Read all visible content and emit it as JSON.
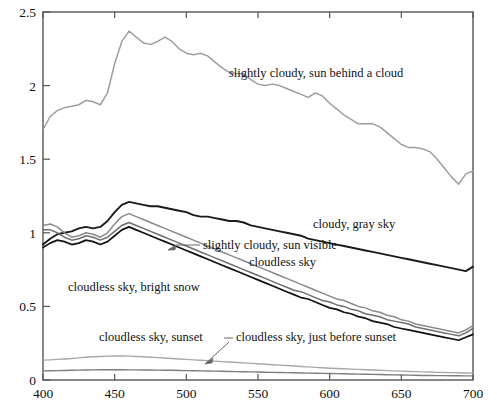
{
  "chart_data": {
    "type": "line",
    "title": "",
    "xlabel": "",
    "ylabel": "",
    "xlim": [
      400,
      700
    ],
    "ylim": [
      0,
      2.5
    ],
    "xticks": [
      400,
      450,
      500,
      550,
      600,
      650,
      700
    ],
    "yticks": [
      0,
      0.5,
      1,
      1.5,
      2,
      2.5
    ],
    "xtick_labels": [
      "400",
      "450",
      "500",
      "550",
      "600",
      "650",
      "700"
    ],
    "ytick_labels": [
      "0",
      "0.5",
      "1",
      "1.5",
      "2",
      "2.5"
    ],
    "grid": false,
    "legend": "inline-annotations",
    "x": [
      400,
      405,
      410,
      415,
      420,
      425,
      430,
      435,
      440,
      445,
      450,
      455,
      460,
      465,
      470,
      475,
      480,
      485,
      490,
      495,
      500,
      505,
      510,
      515,
      520,
      525,
      530,
      535,
      540,
      545,
      550,
      555,
      560,
      565,
      570,
      575,
      580,
      585,
      590,
      595,
      600,
      605,
      610,
      615,
      620,
      625,
      630,
      635,
      640,
      645,
      650,
      655,
      660,
      665,
      670,
      675,
      680,
      685,
      690,
      695,
      700
    ],
    "series": [
      {
        "name": "slightly cloudy, sun behind a cloud",
        "color": "#9e9e9e",
        "width": 1.5,
        "values": [
          1.7,
          1.79,
          1.83,
          1.85,
          1.86,
          1.87,
          1.9,
          1.89,
          1.87,
          1.95,
          2.15,
          2.3,
          2.37,
          2.33,
          2.29,
          2.28,
          2.3,
          2.33,
          2.3,
          2.25,
          2.22,
          2.21,
          2.22,
          2.2,
          2.16,
          2.12,
          2.09,
          2.08,
          2.08,
          2.04,
          2.01,
          2.0,
          2.01,
          2.0,
          1.98,
          1.96,
          1.94,
          1.92,
          1.95,
          1.93,
          1.88,
          1.84,
          1.8,
          1.77,
          1.74,
          1.74,
          1.74,
          1.72,
          1.68,
          1.64,
          1.6,
          1.58,
          1.58,
          1.57,
          1.55,
          1.5,
          1.44,
          1.38,
          1.33,
          1.4,
          1.42
        ]
      },
      {
        "name": "cloudy, gray sky",
        "color": "#1a1a1a",
        "width": 1.9,
        "values": [
          0.92,
          0.96,
          0.99,
          1.0,
          1.01,
          1.03,
          1.04,
          1.03,
          1.04,
          1.08,
          1.14,
          1.19,
          1.21,
          1.2,
          1.19,
          1.18,
          1.18,
          1.17,
          1.16,
          1.15,
          1.14,
          1.12,
          1.11,
          1.11,
          1.1,
          1.09,
          1.08,
          1.08,
          1.07,
          1.05,
          1.04,
          1.03,
          1.02,
          1.01,
          1.0,
          0.99,
          0.98,
          0.96,
          0.95,
          0.94,
          0.93,
          0.92,
          0.91,
          0.9,
          0.89,
          0.88,
          0.87,
          0.86,
          0.85,
          0.84,
          0.83,
          0.82,
          0.81,
          0.8,
          0.79,
          0.78,
          0.77,
          0.76,
          0.75,
          0.74,
          0.77
        ]
      },
      {
        "name": "slightly cloudy, sun visible",
        "color": "#8a8a8a",
        "width": 1.5,
        "values": [
          1.05,
          1.06,
          1.04,
          1.0,
          0.97,
          0.98,
          1.0,
          0.99,
          0.97,
          1.0,
          1.06,
          1.11,
          1.13,
          1.11,
          1.09,
          1.07,
          1.05,
          1.03,
          1.01,
          0.99,
          0.97,
          0.95,
          0.93,
          0.91,
          0.89,
          0.87,
          0.85,
          0.83,
          0.81,
          0.79,
          0.77,
          0.75,
          0.73,
          0.71,
          0.69,
          0.67,
          0.65,
          0.63,
          0.61,
          0.59,
          0.57,
          0.55,
          0.54,
          0.52,
          0.5,
          0.49,
          0.47,
          0.46,
          0.44,
          0.43,
          0.41,
          0.4,
          0.38,
          0.37,
          0.36,
          0.35,
          0.34,
          0.33,
          0.32,
          0.34,
          0.37
        ]
      },
      {
        "name": "cloudless sky",
        "color": "#6e6e6e",
        "width": 1.5,
        "values": [
          1.02,
          1.02,
          1.0,
          0.97,
          0.95,
          0.96,
          0.98,
          0.97,
          0.95,
          0.97,
          1.01,
          1.05,
          1.07,
          1.05,
          1.03,
          1.01,
          0.99,
          0.97,
          0.95,
          0.93,
          0.91,
          0.89,
          0.87,
          0.85,
          0.83,
          0.81,
          0.79,
          0.77,
          0.75,
          0.73,
          0.71,
          0.69,
          0.67,
          0.65,
          0.63,
          0.61,
          0.6,
          0.58,
          0.56,
          0.54,
          0.53,
          0.51,
          0.5,
          0.48,
          0.47,
          0.45,
          0.44,
          0.43,
          0.41,
          0.4,
          0.39,
          0.38,
          0.36,
          0.35,
          0.34,
          0.33,
          0.32,
          0.31,
          0.3,
          0.32,
          0.35
        ]
      },
      {
        "name": "cloudless sky, bright snow",
        "color": "#111111",
        "width": 1.7,
        "values": [
          0.9,
          0.93,
          0.95,
          0.94,
          0.92,
          0.93,
          0.95,
          0.94,
          0.92,
          0.94,
          0.98,
          1.02,
          1.04,
          1.02,
          1.0,
          0.98,
          0.96,
          0.94,
          0.92,
          0.9,
          0.88,
          0.86,
          0.84,
          0.82,
          0.8,
          0.78,
          0.76,
          0.74,
          0.72,
          0.7,
          0.68,
          0.66,
          0.64,
          0.62,
          0.6,
          0.58,
          0.56,
          0.55,
          0.53,
          0.51,
          0.49,
          0.48,
          0.46,
          0.45,
          0.43,
          0.42,
          0.4,
          0.39,
          0.38,
          0.36,
          0.35,
          0.34,
          0.33,
          0.32,
          0.31,
          0.3,
          0.29,
          0.28,
          0.27,
          0.29,
          0.31
        ]
      },
      {
        "name": "cloudless sky, sunset",
        "color": "#a8a8a8",
        "width": 1.4,
        "values": [
          0.135,
          0.137,
          0.14,
          0.143,
          0.146,
          0.15,
          0.155,
          0.158,
          0.16,
          0.162,
          0.163,
          0.163,
          0.162,
          0.16,
          0.158,
          0.155,
          0.152,
          0.149,
          0.146,
          0.143,
          0.14,
          0.137,
          0.134,
          0.131,
          0.128,
          0.125,
          0.122,
          0.119,
          0.116,
          0.113,
          0.11,
          0.107,
          0.104,
          0.101,
          0.098,
          0.095,
          0.092,
          0.089,
          0.086,
          0.083,
          0.08,
          0.078,
          0.076,
          0.074,
          0.072,
          0.07,
          0.068,
          0.066,
          0.064,
          0.062,
          0.06,
          0.058,
          0.057,
          0.055,
          0.054,
          0.052,
          0.051,
          0.05,
          0.049,
          0.048,
          0.047
        ]
      },
      {
        "name": "cloudless sky, just before sunset",
        "color": "#7d7d7d",
        "width": 1.4,
        "values": [
          0.062,
          0.063,
          0.064,
          0.065,
          0.066,
          0.067,
          0.068,
          0.069,
          0.07,
          0.07,
          0.07,
          0.07,
          0.069,
          0.069,
          0.068,
          0.068,
          0.067,
          0.066,
          0.066,
          0.065,
          0.064,
          0.063,
          0.062,
          0.061,
          0.06,
          0.059,
          0.058,
          0.057,
          0.056,
          0.055,
          0.054,
          0.053,
          0.052,
          0.051,
          0.05,
          0.049,
          0.048,
          0.047,
          0.046,
          0.045,
          0.044,
          0.043,
          0.042,
          0.041,
          0.04,
          0.039,
          0.038,
          0.037,
          0.036,
          0.035,
          0.034,
          0.033,
          0.032,
          0.031,
          0.031,
          0.03,
          0.03,
          0.029,
          0.029,
          0.028,
          0.028
        ]
      }
    ],
    "annotations": [
      {
        "id": "ann-sun-behind-cloud",
        "text": "slightly cloudy, sun behind a cloud",
        "x": 229,
        "y": 77,
        "anchor": "start",
        "leader": false
      },
      {
        "id": "ann-cloudy-gray-sky",
        "text": "cloudy, gray sky",
        "x": 313,
        "y": 228,
        "anchor": "start",
        "leader": false
      },
      {
        "id": "ann-sun-visible",
        "text": "slightly cloudy, sun visible",
        "x": 203,
        "y": 249,
        "anchor": "start",
        "leader": true,
        "leader_path": "M 200 245 L 176 245 L 168 250"
      },
      {
        "id": "ann-cloudless-sky",
        "text": "cloudless sky",
        "x": 249,
        "y": 266,
        "anchor": "start",
        "leader": false
      },
      {
        "id": "ann-bright-snow",
        "text": "cloudless sky, bright snow",
        "x": 68,
        "y": 291,
        "anchor": "start",
        "leader": false
      },
      {
        "id": "ann-sunset",
        "text": "cloudless sky, sunset",
        "x": 99,
        "y": 341,
        "anchor": "start",
        "leader": false
      },
      {
        "id": "ann-just-before-sunset",
        "text": "cloudless sky, just before sunset",
        "x": 236,
        "y": 341,
        "anchor": "start",
        "leader": true,
        "leader_path": "M 233 338 L 224 338 M 229 342 L 205 364"
      }
    ]
  },
  "axes": {
    "frame_color": "#555555",
    "left": 43,
    "right": 473,
    "top": 12,
    "bottom": 380
  }
}
